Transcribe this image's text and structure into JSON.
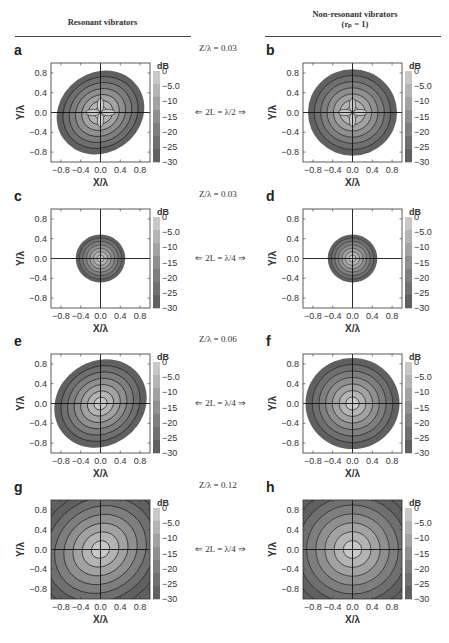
{
  "headers": {
    "left": "Resonant vibrators",
    "right_line1": "Non-resonant vibrators",
    "right_line2": "(rₚ = 1)"
  },
  "rows": [
    {
      "z_label": "Z/λ = 0.03",
      "l_label": "⇐ 2L = λ/2 ⇒",
      "left_letter": "a",
      "right_letter": "b"
    },
    {
      "z_label": "Z/λ = 0.03",
      "l_label": "⇐ 2L = λ/4 ⇒",
      "left_letter": "c",
      "right_letter": "d"
    },
    {
      "z_label": "Z/λ = 0.06",
      "l_label": "⇐ 2L = λ/4 ⇒",
      "left_letter": "e",
      "right_letter": "f"
    },
    {
      "z_label": "Z/λ = 0.12",
      "l_label": "⇐ 2L = λ/4 ⇒",
      "left_letter": "g",
      "right_letter": "h"
    }
  ],
  "axes": {
    "xlabel": "X/λ",
    "ylabel": "Y/λ",
    "x_ticks": [
      "−0.8",
      "−0.4",
      "0.0",
      "0.4",
      "0.8"
    ],
    "y_ticks": [
      "0.8",
      "0.4",
      "0.0",
      "−0.4",
      "−0.8"
    ],
    "colorbar_title": "dB",
    "colorbar_ticks": [
      "0",
      "−5.0",
      "−10",
      "−15",
      "−20",
      "−25",
      "−30"
    ]
  },
  "colors": {
    "level_0": "#c8c8c8",
    "level_5": "#b4b4b4",
    "level_10": "#a2a2a2",
    "level_15": "#8f8f8f",
    "level_20": "#7e7e7e",
    "level_25": "#6f6f6f",
    "level_30": "#606060",
    "frame": "#333333"
  },
  "chart_data": [
    {
      "panel": "a",
      "type": "heatmap",
      "title": "Resonant vibrators, Z/λ = 0.03, 2L = λ/2",
      "xlabel": "X/λ",
      "ylabel": "Y/λ",
      "xlim": [
        -1,
        1
      ],
      "ylim": [
        -1,
        1
      ],
      "colorbar": {
        "label": "dB",
        "range": [
          -30,
          0
        ],
        "ticks": [
          0,
          -5,
          -10,
          -15,
          -20,
          -25,
          -30
        ]
      },
      "shape": "tilted elliptical contours, four-lobed (cross) pattern near centre; outer -30 dB boundary radius ~0.9"
    },
    {
      "panel": "b",
      "type": "heatmap",
      "title": "Non-resonant vibrators (r_p = 1), Z/λ = 0.03, 2L = λ/2",
      "xlabel": "X/λ",
      "ylabel": "Y/λ",
      "xlim": [
        -1,
        1
      ],
      "ylim": [
        -1,
        1
      ],
      "colorbar": {
        "label": "dB",
        "range": [
          -30,
          0
        ],
        "ticks": [
          0,
          -5,
          -10,
          -15,
          -20,
          -25,
          -30
        ]
      },
      "shape": "near-circular contours, four-lobed pattern near centre; outer boundary radius ~0.9"
    },
    {
      "panel": "c",
      "type": "heatmap",
      "title": "Resonant vibrators, Z/λ = 0.03, 2L = λ/4",
      "xlabel": "X/λ",
      "ylabel": "Y/λ",
      "xlim": [
        -1,
        1
      ],
      "ylim": [
        -1,
        1
      ],
      "colorbar": {
        "label": "dB",
        "range": [
          -30,
          0
        ],
        "ticks": [
          0,
          -5,
          -10,
          -15,
          -20,
          -25,
          -30
        ]
      },
      "shape": "compact contours, outer boundary radius ~0.5"
    },
    {
      "panel": "d",
      "type": "heatmap",
      "title": "Non-resonant vibrators (r_p = 1), Z/λ = 0.03, 2L = λ/4",
      "xlabel": "X/λ",
      "ylabel": "Y/λ",
      "xlim": [
        -1,
        1
      ],
      "ylim": [
        -1,
        1
      ],
      "colorbar": {
        "label": "dB",
        "range": [
          -30,
          0
        ],
        "ticks": [
          0,
          -5,
          -10,
          -15,
          -20,
          -25,
          -30
        ]
      },
      "shape": "compact circular contours, outer boundary radius ~0.5"
    },
    {
      "panel": "e",
      "type": "heatmap",
      "title": "Resonant vibrators, Z/λ = 0.06, 2L = λ/4",
      "xlabel": "X/λ",
      "ylabel": "Y/λ",
      "xlim": [
        -1,
        1
      ],
      "ylim": [
        -1,
        1
      ],
      "colorbar": {
        "label": "dB",
        "range": [
          -30,
          0
        ],
        "ticks": [
          0,
          -5,
          -10,
          -15,
          -20,
          -25,
          -30
        ]
      },
      "shape": "tilted elliptical contours, outer boundary radius ~0.95"
    },
    {
      "panel": "f",
      "type": "heatmap",
      "title": "Non-resonant vibrators (r_p = 1), Z/λ = 0.06, 2L = λ/4",
      "xlabel": "X/λ",
      "ylabel": "Y/λ",
      "xlim": [
        -1,
        1
      ],
      "ylim": [
        -1,
        1
      ],
      "colorbar": {
        "label": "dB",
        "range": [
          -30,
          0
        ],
        "ticks": [
          0,
          -5,
          -10,
          -15,
          -20,
          -25,
          -30
        ]
      },
      "shape": "circular contours, outer boundary radius ~0.95"
    },
    {
      "panel": "g",
      "type": "heatmap",
      "title": "Resonant vibrators, Z/λ = 0.12, 2L = λ/4",
      "xlabel": "X/λ",
      "ylabel": "Y/λ",
      "xlim": [
        -1,
        1
      ],
      "ylim": [
        -1,
        1
      ],
      "colorbar": {
        "label": "dB",
        "range": [
          -30,
          0
        ],
        "ticks": [
          0,
          -5,
          -10,
          -15,
          -20,
          -25,
          -30
        ]
      },
      "shape": "tilted elliptical contours filling entire domain"
    },
    {
      "panel": "h",
      "type": "heatmap",
      "title": "Non-resonant vibrators (r_p = 1), Z/λ = 0.12, 2L = λ/4",
      "xlabel": "X/λ",
      "ylabel": "Y/λ",
      "xlim": [
        -1,
        1
      ],
      "ylim": [
        -1,
        1
      ],
      "colorbar": {
        "label": "dB",
        "range": [
          -30,
          0
        ],
        "ticks": [
          0,
          -5,
          -10,
          -15,
          -20,
          -25,
          -30
        ]
      },
      "shape": "circular contours filling entire domain"
    }
  ]
}
